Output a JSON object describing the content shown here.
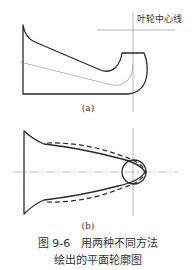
{
  "figure_a": {
    "annotation": "叶轮中心线",
    "sublabel": "(a)"
  },
  "figure_b": {
    "sublabel": "(b)"
  },
  "caption": {
    "line1": "图 9-6　用两种不同方法",
    "line2": "绘出的平面轮廓图"
  }
}
